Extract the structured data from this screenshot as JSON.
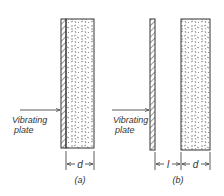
{
  "diagram": {
    "panels": [
      {
        "id": "a",
        "caption": "(a)",
        "plate_label_line1": "Vibrating",
        "plate_label_line2": "plate",
        "dimensions": [
          {
            "symbol": "d"
          }
        ]
      },
      {
        "id": "b",
        "caption": "(b)",
        "plate_label_line1": "Vibrating",
        "plate_label_line2": "plate",
        "dimensions": [
          {
            "symbol": "l"
          },
          {
            "symbol": "d"
          }
        ]
      }
    ],
    "colors": {
      "line": "#333333",
      "background": "#ffffff"
    }
  }
}
